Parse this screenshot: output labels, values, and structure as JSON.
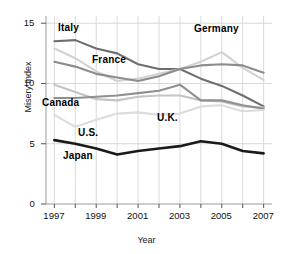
{
  "chart_data": {
    "type": "line",
    "title": "",
    "xlabel": "Year",
    "ylabel": "Misery Index",
    "x": [
      1997,
      1998,
      1999,
      2000,
      2001,
      2002,
      2003,
      2004,
      2005,
      2006,
      2007
    ],
    "xticks": [
      "1997",
      "1999",
      "2001",
      "2003",
      "2005",
      "2007"
    ],
    "xtick_values": [
      1997,
      1999,
      2001,
      2003,
      2005,
      2007
    ],
    "yticks": [
      "0",
      "5",
      "10",
      "15"
    ],
    "ytick_values": [
      0,
      5,
      10,
      15
    ],
    "xlim": [
      1996.6,
      2007.4
    ],
    "ylim": [
      0,
      15.6
    ],
    "grid": "vertical-and-horizontal",
    "legend": "inline-labels",
    "series": [
      {
        "name": "Italy",
        "color": "#6e6e6e",
        "values": [
          13.5,
          13.6,
          12.9,
          12.5,
          11.6,
          11.2,
          11.2,
          10.4,
          9.8,
          9.0,
          8.1
        ]
      },
      {
        "name": "Germany",
        "color": "#d2d2d2",
        "values": [
          12.9,
          12.1,
          11.0,
          10.2,
          10.4,
          10.8,
          11.2,
          11.8,
          12.6,
          11.3,
          10.3
        ]
      },
      {
        "name": "France",
        "color": "#8c8c8c",
        "values": [
          11.8,
          11.4,
          10.8,
          10.5,
          10.2,
          10.6,
          11.2,
          11.5,
          11.6,
          11.5,
          10.9
        ]
      },
      {
        "name": "Canada",
        "color": "#c4c4c4",
        "values": [
          9.9,
          9.3,
          8.7,
          8.6,
          8.9,
          9.0,
          9.0,
          8.6,
          8.5,
          8.1,
          8.0
        ]
      },
      {
        "name": "U.K.",
        "color": "#909090",
        "values": [
          8.8,
          8.8,
          8.9,
          9.0,
          9.2,
          9.4,
          9.9,
          8.6,
          8.6,
          8.2,
          7.9
        ]
      },
      {
        "name": "U.S.",
        "color": "#dcdcdc",
        "values": [
          7.4,
          6.4,
          7.0,
          7.5,
          7.6,
          7.4,
          7.5,
          8.1,
          8.2,
          7.7,
          7.8
        ]
      },
      {
        "name": "Japan",
        "color": "#1a1a1a",
        "values": [
          5.3,
          5.0,
          4.6,
          4.1,
          4.4,
          4.6,
          4.8,
          5.2,
          5.0,
          4.4,
          4.2
        ]
      }
    ],
    "annotations": [
      {
        "text": "Italy",
        "x_px": 58,
        "y_px": 22
      },
      {
        "text": "Germany",
        "x_px": 194,
        "y_px": 23
      },
      {
        "text": "France",
        "x_px": 92,
        "y_px": 54
      },
      {
        "text": "Canada",
        "x_px": 42,
        "y_px": 97
      },
      {
        "text": "U.S.",
        "x_px": 78,
        "y_px": 127
      },
      {
        "text": "U.K.",
        "x_px": 157,
        "y_px": 112
      },
      {
        "text": "Japan",
        "x_px": 63,
        "y_px": 150
      }
    ]
  }
}
